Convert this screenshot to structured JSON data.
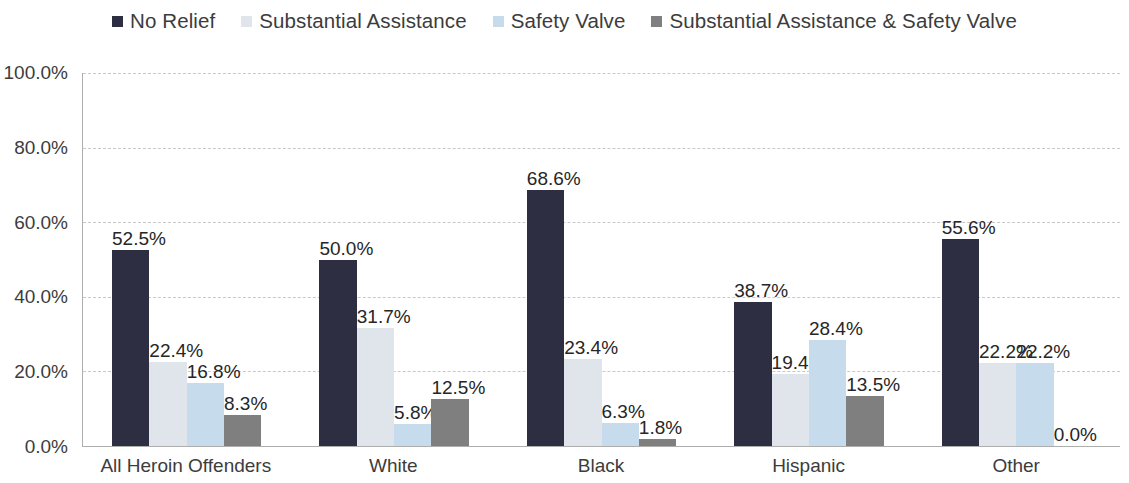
{
  "chart_data": {
    "type": "bar",
    "title": "",
    "subtitle": "",
    "xlabel": "",
    "ylabel": "",
    "ylim": [
      0,
      100
    ],
    "grid": true,
    "legend_position": "top",
    "y_ticks": [
      "0.0%",
      "20.0%",
      "40.0%",
      "60.0%",
      "80.0%",
      "100.0%"
    ],
    "y_tick_values": [
      0,
      20,
      40,
      60,
      80,
      100
    ],
    "categories": [
      "All Heroin Offenders",
      "White",
      "Black",
      "Hispanic",
      "Other"
    ],
    "series": [
      {
        "name": "No Relief",
        "color": "#2e2e42",
        "values": [
          52.5,
          50.0,
          68.6,
          38.7,
          55.6
        ],
        "labels": [
          "52.5%",
          "50.0%",
          "68.6%",
          "38.7%",
          "55.6%"
        ]
      },
      {
        "name": "Substantial Assistance",
        "color": "#dfe5ea",
        "values": [
          22.4,
          31.7,
          23.4,
          19.4,
          22.2
        ],
        "labels": [
          "22.4%",
          "31.7%",
          "23.4%",
          "19.4%",
          "22.2%"
        ]
      },
      {
        "name": "Safety Valve",
        "color": "#c6dced",
        "values": [
          16.8,
          5.8,
          6.3,
          28.4,
          22.2
        ],
        "labels": [
          "16.8%",
          "5.8%",
          "6.3%",
          "28.4%",
          "22.2%"
        ]
      },
      {
        "name": "Substantial Assistance & Safety Valve",
        "color": "#7f7f7f",
        "values": [
          8.3,
          12.5,
          1.8,
          13.5,
          0.0
        ],
        "labels": [
          "8.3%",
          "12.5%",
          "1.8%",
          "13.5%",
          "0.0%"
        ]
      }
    ]
  },
  "legend": {
    "items": [
      {
        "label": "No Relief",
        "color": "#2e2e42"
      },
      {
        "label": "Substantial Assistance",
        "color": "#dfe5ea"
      },
      {
        "label": "Safety Valve",
        "color": "#c6dced"
      },
      {
        "label": "Substantial Assistance & Safety Valve",
        "color": "#7f7f7f"
      }
    ]
  }
}
